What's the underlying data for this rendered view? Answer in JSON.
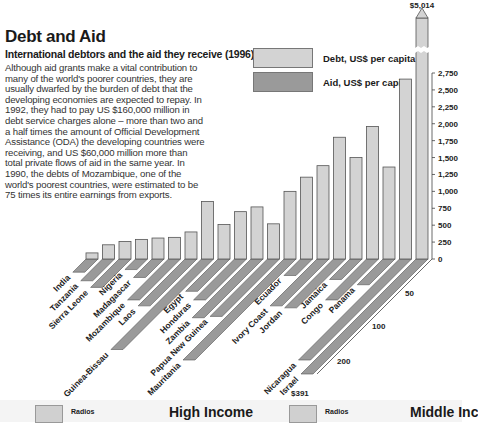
{
  "header": {
    "title": "Debt and Aid",
    "subtitle": "International debtors and the aid they receive (1996)",
    "body": "Although aid grants make a vital contribution to many of the world's poorer countries, they are usually dwarfed by the burden of debt that the developing economies are expected to repay. In 1992, they had to pay US $160,000 million in debt service charges alone – more than two and a half times the amount of Official Development Assistance (ODA) the developing countries were receiving, and US $60,000 million more than total private flows of aid in the same year. In 1990, the debts of Mozambique, one of the world's poorest countries, were estimated to be 75 times its entire earnings from exports."
  },
  "legend": {
    "debt": {
      "label": "Debt, US$ per capita",
      "color": "#d3d3d3"
    },
    "aid": {
      "label": "Aid, US$ per capita",
      "color": "#9a9a9a"
    }
  },
  "annotations": {
    "israel_debt": "$5,014",
    "israel_aid": "$391"
  },
  "footer": {
    "left": {
      "swatch_label": "Radios",
      "heading": "High Income"
    },
    "right": {
      "swatch_label": "Radios",
      "heading": "Middle Inc"
    }
  },
  "chart_data": {
    "type": "bar",
    "title": "Debt and Aid",
    "subtitle": "International debtors and the aid they receive (1996)",
    "xlabel": "",
    "ylabel": "US$ per capita",
    "categories": [
      "India",
      "Tanzania",
      "Sierra Leone",
      "Nigeria",
      "Madagascar",
      "Mozambique",
      "Laos",
      "Guinea-Bissau",
      "Egypt",
      "Honduras",
      "Zambia",
      "Papua New Guinea",
      "Mauritania",
      "Ecuador",
      "Ivory Coast",
      "Jordan",
      "Jamaica",
      "Congo",
      "Panama",
      "Nicaragua",
      "Israel"
    ],
    "series": [
      {
        "name": "Debt, US$ per capita",
        "values": [
          90,
          210,
          260,
          290,
          310,
          320,
          400,
          850,
          510,
          700,
          770,
          520,
          1000,
          1210,
          1380,
          1800,
          1500,
          1960,
          1360,
          2660,
          5014
        ]
      },
      {
        "name": "Aid, US$ per capita",
        "values": [
          20,
          33,
          43,
          16,
          28,
          62,
          71,
          170,
          49,
          62,
          89,
          87,
          205,
          25,
          71,
          74,
          31,
          62,
          39,
          200,
          391
        ]
      }
    ],
    "debt_axis": {
      "ticks": [
        0,
        250,
        500,
        750,
        1000,
        1250,
        1500,
        1750,
        2000,
        2250,
        2500,
        2750
      ],
      "tick_labels": [
        "0",
        "250",
        "500",
        "750",
        "1,000",
        "1,250",
        "1,500",
        "1,750",
        "2,000",
        "2,250",
        "2,500",
        "2,750"
      ],
      "ylim": [
        0,
        2750
      ]
    },
    "aid_axis": {
      "ticks": [
        50,
        100,
        200
      ],
      "tick_labels": [
        "50",
        "100",
        "200"
      ]
    },
    "legend_position": "top-right",
    "grid": false,
    "broken_bars": [
      "Israel"
    ]
  }
}
